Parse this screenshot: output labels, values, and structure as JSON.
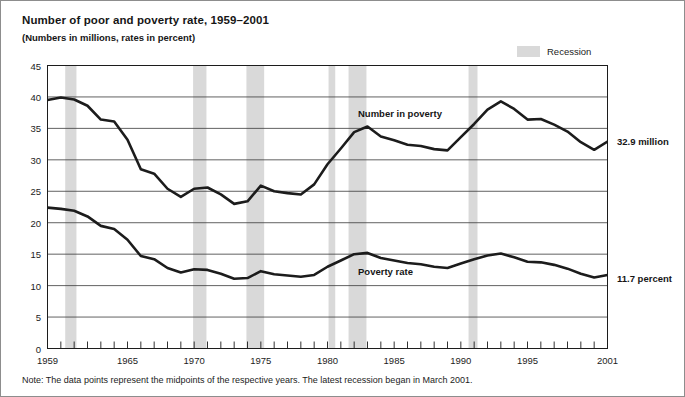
{
  "title": "Number of poor and poverty rate, 1959–2001",
  "subtitle": "(Numbers in millions, rates in percent)",
  "legend": {
    "recession_label": "Recession",
    "swatch_color": "#d9d9d9"
  },
  "annotations": {
    "number_in_poverty_tag": "Number in poverty",
    "poverty_rate_tag": "Poverty rate",
    "number_in_poverty_value": "32.9 million",
    "poverty_rate_value": "11.7 percent"
  },
  "note": "Note: The data points represent the midpoints of the respective years. The latest recession began in March 2001.",
  "chart_data": {
    "type": "line",
    "title": "Number of poor and poverty rate, 1959–2001",
    "subtitle": "(Numbers in millions, rates in percent)",
    "xlabel": "",
    "ylabel": "",
    "xlim": [
      1959,
      2001
    ],
    "ylim": [
      0,
      45
    ],
    "yticks": [
      0,
      5,
      10,
      15,
      20,
      25,
      30,
      35,
      40,
      45
    ],
    "xticks": [
      1959,
      1965,
      1970,
      1975,
      1980,
      1985,
      1990,
      1995,
      2001
    ],
    "xtick_labels": [
      "1959",
      "1965",
      "1970",
      "1975",
      "1980",
      "1985",
      "1990",
      "1995",
      "2001"
    ],
    "minor_xticks_every": 1,
    "grid": "horizontal",
    "legend_position": "top-right",
    "line_color": "#1c1c1c",
    "x": [
      1959,
      1960,
      1961,
      1962,
      1963,
      1964,
      1965,
      1966,
      1967,
      1968,
      1969,
      1970,
      1971,
      1972,
      1973,
      1974,
      1975,
      1976,
      1977,
      1978,
      1979,
      1980,
      1981,
      1982,
      1983,
      1984,
      1985,
      1986,
      1987,
      1988,
      1989,
      1990,
      1991,
      1992,
      1993,
      1994,
      1995,
      1996,
      1997,
      1998,
      1999,
      2000,
      2001
    ],
    "series": [
      {
        "name": "Number in poverty",
        "units": "millions",
        "label_text": "Number in poverty",
        "end_label": "32.9 million",
        "values": [
          39.5,
          39.9,
          39.6,
          38.6,
          36.4,
          36.1,
          33.2,
          28.5,
          27.8,
          25.4,
          24.1,
          25.4,
          25.6,
          24.5,
          23.0,
          23.4,
          25.9,
          25.0,
          24.7,
          24.5,
          26.1,
          29.3,
          31.8,
          34.4,
          35.3,
          33.7,
          33.1,
          32.4,
          32.2,
          31.7,
          31.5,
          33.6,
          35.7,
          38.0,
          39.3,
          38.1,
          36.4,
          36.5,
          35.6,
          34.5,
          32.8,
          31.6,
          32.9
        ]
      },
      {
        "name": "Poverty rate",
        "units": "percent",
        "label_text": "Poverty rate",
        "end_label": "11.7 percent",
        "values": [
          22.4,
          22.2,
          21.9,
          21.0,
          19.5,
          19.0,
          17.3,
          14.7,
          14.2,
          12.8,
          12.1,
          12.6,
          12.5,
          11.9,
          11.1,
          11.2,
          12.3,
          11.8,
          11.6,
          11.4,
          11.7,
          13.0,
          14.0,
          15.0,
          15.2,
          14.4,
          14.0,
          13.6,
          13.4,
          13.0,
          12.8,
          13.5,
          14.2,
          14.8,
          15.1,
          14.5,
          13.8,
          13.7,
          13.3,
          12.7,
          11.9,
          11.3,
          11.7
        ]
      }
    ],
    "recessions": [
      {
        "start": 1960.33,
        "end": 1961.17
      },
      {
        "start": 1969.92,
        "end": 1970.92
      },
      {
        "start": 1973.92,
        "end": 1975.25
      },
      {
        "start": 1980.08,
        "end": 1980.58
      },
      {
        "start": 1981.58,
        "end": 1982.92
      },
      {
        "start": 1990.58,
        "end": 1991.25
      },
      {
        "start": 2001.2,
        "end": 2001.6
      }
    ]
  }
}
